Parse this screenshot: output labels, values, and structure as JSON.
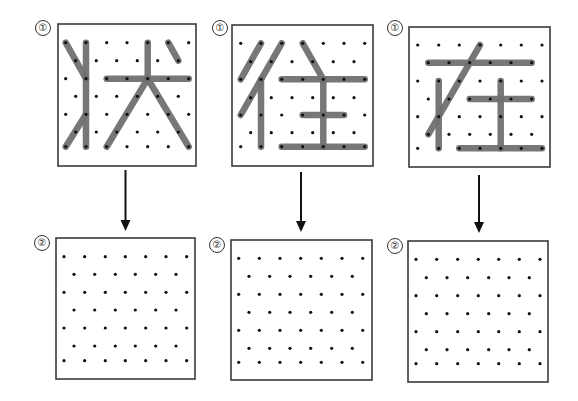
{
  "diagram": {
    "colors": {
      "background": "#ffffff",
      "box_border": "#3a3a3a",
      "dot": "#111111",
      "stroke": "#707070",
      "arrow": "#111111",
      "label": "#222222"
    },
    "grid_spec": {
      "rows": 7,
      "pattern": "staggered: even rows 7 pegs, odd rows 6 pegs offset half a step"
    },
    "panels": [
      {
        "id": "panel-zhuang",
        "character": "状",
        "top": {
          "label": "①",
          "label_pos": [
            43,
            28
          ],
          "box": [
            58,
            24,
            138,
            142
          ],
          "row_y": [
            42.7,
            60.7,
            78.7,
            96.3,
            114.3,
            132,
            146.7
          ],
          "even_x": [
            65.7,
            86,
            106.7,
            127,
            147.7,
            168.3,
            188.7
          ],
          "odd_x": [
            75.7,
            96.3,
            116.7,
            137.3,
            157.7,
            178.3
          ],
          "strokes": [
            {
              "from": [
                0,
                0
              ],
              "to": [
                2,
                1
              ],
              "desc": "left upper dot stroke"
            },
            {
              "from": [
                0,
                1
              ],
              "to": [
                6,
                1
              ],
              "desc": "vertical"
            },
            {
              "from": [
                6,
                0
              ],
              "to": [
                4,
                1
              ],
              "desc": "left lower rising stroke"
            },
            {
              "from": [
                2,
                2
              ],
              "to": [
                2,
                6
              ],
              "desc": "horizontal"
            },
            {
              "from": [
                0,
                4
              ],
              "to": [
                2,
                4
              ],
              "desc": "top vertical of 犬"
            },
            {
              "from": [
                2,
                4
              ],
              "to": [
                6,
                2
              ],
              "desc": "left-falling"
            },
            {
              "from": [
                2,
                4
              ],
              "to": [
                6,
                6
              ],
              "desc": "right-falling"
            },
            {
              "from": [
                0,
                5
              ],
              "to": [
                1,
                5
              ],
              "desc": "dot"
            }
          ]
        },
        "arrow": {
          "x": 125.5,
          "y1": 170,
          "y2": 231
        },
        "bottom": {
          "label": "②",
          "label_pos": [
            42,
            243
          ],
          "box": [
            56,
            238,
            139,
            141
          ],
          "row_y": [
            256.7,
            274.3,
            292.3,
            310,
            328,
            346,
            360.7
          ],
          "even_x": [
            64,
            84.7,
            105.3,
            125.3,
            145.7,
            166,
            186.7
          ],
          "odd_x": [
            74,
            94.7,
            115.3,
            135.3,
            155.7,
            176
          ]
        }
      },
      {
        "id": "panel-wang",
        "character": "往",
        "top": {
          "label": "①",
          "label_pos": [
            220,
            28
          ],
          "box": [
            232,
            25,
            141,
            141
          ],
          "row_y": [
            43.3,
            61.7,
            79.3,
            97.7,
            115,
            132.7,
            146.7
          ],
          "even_x": [
            240.7,
            261,
            281.7,
            302.7,
            323.3,
            344,
            364.7
          ],
          "odd_x": [
            250.7,
            271.3,
            292,
            312.7,
            333.3,
            354
          ],
          "strokes": [
            {
              "from": [
                0,
                1
              ],
              "to": [
                2,
                0
              ],
              "desc": "first left-falling"
            },
            {
              "from": [
                0,
                2
              ],
              "to": [
                4,
                0
              ],
              "desc": "second left-falling"
            },
            {
              "from": [
                2,
                1
              ],
              "to": [
                6,
                1
              ],
              "desc": "vertical of 彳"
            },
            {
              "from": [
                0,
                3
              ],
              "to": [
                2,
                4
              ],
              "desc": "dot of 主"
            },
            {
              "from": [
                2,
                2
              ],
              "to": [
                2,
                6
              ],
              "desc": "top horizontal"
            },
            {
              "from": [
                2,
                4
              ],
              "to": [
                6,
                4
              ],
              "desc": "vertical of 主"
            },
            {
              "from": [
                4,
                3
              ],
              "to": [
                4,
                5
              ],
              "desc": "middle horizontal"
            },
            {
              "from": [
                6,
                2
              ],
              "to": [
                6,
                6
              ],
              "desc": "bottom horizontal"
            }
          ]
        },
        "arrow": {
          "x": 301,
          "y1": 172,
          "y2": 232
        },
        "bottom": {
          "label": "②",
          "label_pos": [
            217,
            245
          ],
          "box": [
            231,
            240,
            141,
            140
          ],
          "row_y": [
            258.3,
            276.3,
            294.3,
            312.3,
            330.3,
            348.3,
            362.3
          ],
          "even_x": [
            238.7,
            259.3,
            280,
            300.7,
            321.3,
            342,
            362.7
          ],
          "odd_x": [
            249,
            269.7,
            290,
            310.7,
            331.7,
            352.3
          ]
        }
      },
      {
        "id": "panel-zai",
        "character": "在",
        "top": {
          "label": "①",
          "label_pos": [
            395,
            28
          ],
          "box": [
            409,
            27,
            141,
            140
          ],
          "row_y": [
            45,
            62.7,
            81,
            99,
            116.7,
            134.3,
            148.3
          ],
          "even_x": [
            417.7,
            438.7,
            459.3,
            480,
            500.7,
            521.3,
            542
          ],
          "odd_x": [
            428.3,
            449,
            469.7,
            490.3,
            511,
            531.7
          ],
          "strokes": [
            {
              "from": [
                1,
                0
              ],
              "to": [
                1,
                5
              ],
              "desc": "top horizontal"
            },
            {
              "from": [
                0,
                3
              ],
              "to": [
                5,
                0
              ],
              "desc": "left-falling"
            },
            {
              "from": [
                2,
                1
              ],
              "to": [
                6,
                1
              ],
              "desc": "vertical left"
            },
            {
              "from": [
                3,
                2
              ],
              "to": [
                3,
                5
              ],
              "desc": "middle horizontal"
            },
            {
              "from": [
                2,
                4
              ],
              "to": [
                6,
                4
              ],
              "desc": "vertical of 土"
            },
            {
              "from": [
                6,
                2
              ],
              "to": [
                6,
                6
              ],
              "desc": "bottom horizontal"
            }
          ]
        },
        "arrow": {
          "x": 479,
          "y1": 175,
          "y2": 233
        },
        "bottom": {
          "label": "②",
          "label_pos": [
            395,
            246
          ],
          "box": [
            408,
            241,
            140,
            141
          ],
          "row_y": [
            259.3,
            277.7,
            295.7,
            313.7,
            331.7,
            349.7,
            363.7
          ],
          "even_x": [
            416,
            436.7,
            457.7,
            478.3,
            498.7,
            519.3,
            540
          ],
          "odd_x": [
            426.3,
            447,
            467.7,
            488.7,
            509,
            529.3
          ]
        }
      }
    ]
  }
}
